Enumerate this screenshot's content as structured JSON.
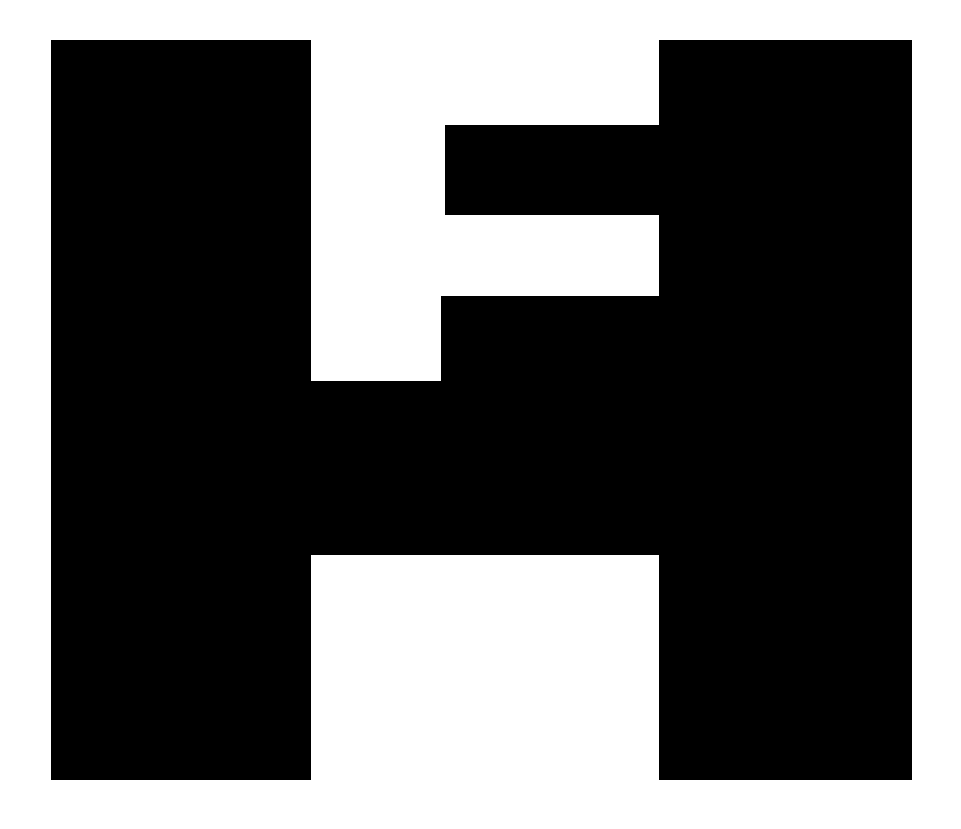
{
  "logo": {
    "description": "Black geometric monogram resembling an H combined with an F",
    "foreground_color": "#000000",
    "background_color": "#ffffff",
    "shapes": [
      {
        "name": "left-pillar",
        "x": 51,
        "y": 40,
        "w": 260,
        "h": 740
      },
      {
        "name": "right-pillar",
        "x": 659,
        "y": 40,
        "w": 253,
        "h": 740
      },
      {
        "name": "upper-arm",
        "x": 445,
        "y": 125,
        "w": 214,
        "h": 90
      },
      {
        "name": "middle-step",
        "x": 441,
        "y": 296,
        "w": 218,
        "h": 85
      },
      {
        "name": "crossbar",
        "x": 311,
        "y": 381,
        "w": 348,
        "h": 174
      }
    ]
  }
}
